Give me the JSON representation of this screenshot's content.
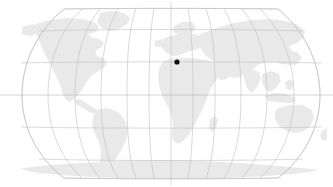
{
  "widget": {
    "name": "world-location-map",
    "title": "World map",
    "projection": "robinson",
    "background_color": "#ffffff",
    "land_color": "#e9e9e9",
    "graticule_color": "#bfbfbf",
    "outline_color": "#c4c4c4",
    "marker_color": "#0c0c0c"
  },
  "map": {
    "viewbox": "0 0 333 187",
    "left_edge_x": 6,
    "right_edge_x": 327,
    "top_edge_y": 8,
    "bottom_edge_y": 179,
    "center_meridian_x": 171,
    "equator_y": 95,
    "parallels_y": [
      8,
      31,
      63,
      95,
      127,
      159,
      179
    ],
    "meridian_count": 13,
    "meridian_spacing_px": 26.75
  },
  "marker": {
    "label": "location-marker",
    "x": 177,
    "y": 62,
    "radius": 2.6
  },
  "landmasses": [
    {
      "id": "north-america",
      "label": "North America"
    },
    {
      "id": "greenland",
      "label": "Greenland"
    },
    {
      "id": "south-america",
      "label": "South America"
    },
    {
      "id": "africa",
      "label": "Africa"
    },
    {
      "id": "europe",
      "label": "Europe"
    },
    {
      "id": "asia",
      "label": "Asia"
    },
    {
      "id": "australia",
      "label": "Australia"
    },
    {
      "id": "antarctica",
      "label": "Antarctica"
    },
    {
      "id": "madagascar",
      "label": "Madagascar"
    },
    {
      "id": "new-zealand",
      "label": "New Zealand"
    },
    {
      "id": "japan",
      "label": "Japan"
    },
    {
      "id": "indonesia",
      "label": "Indonesia"
    },
    {
      "id": "british-isles",
      "label": "British Isles"
    }
  ]
}
